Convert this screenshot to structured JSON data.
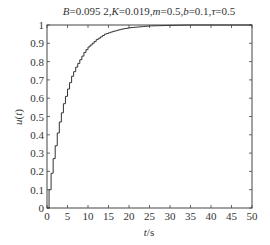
{
  "chart_data": {
    "type": "line",
    "style": "staircase",
    "title": "B=0.095 2,K=0.019,m=0.5,b=0.1,τ=0.5",
    "title_parts": [
      {
        "text": "B",
        "italic": true
      },
      {
        "text": "=0.095 2,",
        "italic": false
      },
      {
        "text": "K",
        "italic": true
      },
      {
        "text": "=0.019,",
        "italic": false
      },
      {
        "text": "m",
        "italic": true
      },
      {
        "text": "=0.5,",
        "italic": false
      },
      {
        "text": "b",
        "italic": true
      },
      {
        "text": "=0.1,",
        "italic": false
      },
      {
        "text": "τ",
        "italic": true
      },
      {
        "text": "=0.5",
        "italic": false
      }
    ],
    "xlabel": "t/s",
    "ylabel": "u(t)",
    "xlim": [
      0,
      50
    ],
    "ylim": [
      0,
      1
    ],
    "xticks": [
      0,
      5,
      10,
      15,
      20,
      25,
      30,
      35,
      40,
      45,
      50
    ],
    "yticks": [
      0,
      0.1,
      0.2,
      0.3,
      0.4,
      0.5,
      0.6,
      0.7,
      0.8,
      0.9,
      1
    ],
    "ytick_labels": [
      "0",
      "0.1",
      "0.2",
      "0.3",
      "0.4",
      "0.5",
      "0.6",
      "0.7",
      "0.8",
      "0.9",
      "1"
    ],
    "grid": false,
    "legend": null,
    "step_interval": 0.5,
    "series": [
      {
        "name": "u(t)",
        "color": "#333333",
        "x": [
          0,
          0.5,
          1,
          1.5,
          2,
          2.5,
          3,
          3.5,
          4,
          4.5,
          5,
          6,
          7,
          8,
          9,
          10,
          12,
          14,
          16,
          18,
          20,
          25,
          30,
          35,
          40,
          45,
          50
        ],
        "y": [
          0,
          0.1,
          0.19,
          0.27,
          0.34,
          0.41,
          0.47,
          0.52,
          0.57,
          0.61,
          0.65,
          0.72,
          0.77,
          0.81,
          0.85,
          0.88,
          0.92,
          0.95,
          0.965,
          0.977,
          0.985,
          0.995,
          0.998,
          1.0,
          1.0,
          1.0,
          1.0
        ]
      }
    ]
  }
}
